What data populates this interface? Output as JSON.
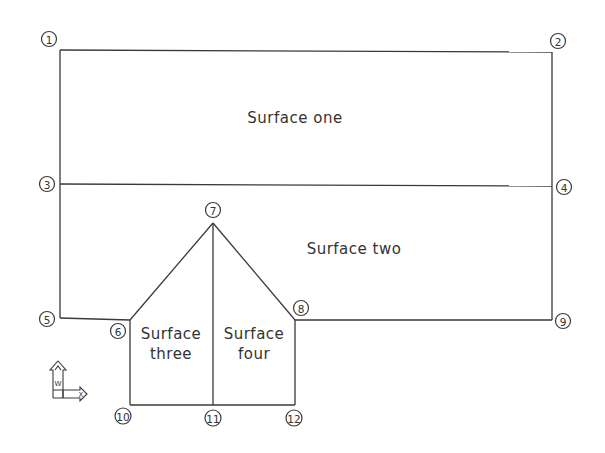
{
  "diagram": {
    "type": "surface-layout",
    "surfaces": [
      {
        "id": "one",
        "label": "Surface one",
        "lines": [
          "Surface one"
        ]
      },
      {
        "id": "two",
        "label": "Surface two",
        "lines": [
          "Surface two"
        ]
      },
      {
        "id": "three",
        "label": "Surface three",
        "lines": [
          "Surface",
          "three"
        ]
      },
      {
        "id": "four",
        "label": "Surface four",
        "lines": [
          "Surface",
          "four"
        ]
      }
    ],
    "nodes": [
      {
        "id": "1",
        "label": "1"
      },
      {
        "id": "2",
        "label": "2"
      },
      {
        "id": "3",
        "label": "3"
      },
      {
        "id": "4",
        "label": "4"
      },
      {
        "id": "5",
        "label": "5"
      },
      {
        "id": "6",
        "label": "6"
      },
      {
        "id": "7",
        "label": "7"
      },
      {
        "id": "8",
        "label": "8"
      },
      {
        "id": "9",
        "label": "9"
      },
      {
        "id": "10",
        "label": "10"
      },
      {
        "id": "11",
        "label": "11"
      },
      {
        "id": "12",
        "label": "12"
      }
    ],
    "ucs_icon": {
      "x_label": "X",
      "y_label": "Y",
      "w_label": "W"
    },
    "colors": {
      "line": "#3a3a3a",
      "text": "#333333",
      "background": "#ffffff"
    }
  }
}
